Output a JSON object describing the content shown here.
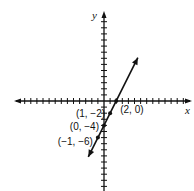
{
  "chart_data": {
    "type": "line",
    "title": "",
    "xlabel": "x",
    "ylabel": "y",
    "xlim": [
      -10,
      10
    ],
    "ylim": [
      -10,
      10
    ],
    "grid": false,
    "tick_spacing": 1,
    "line": {
      "slope": 2,
      "intercept": -4,
      "equation": "y = 2x - 4",
      "arrows_both_ends": true
    },
    "points": [
      {
        "x": 2,
        "y": 0,
        "label": "(2, 0)"
      },
      {
        "x": 1,
        "y": -2,
        "label": "(1, −2)"
      },
      {
        "x": 0,
        "y": -4,
        "label": "(0, −4)"
      },
      {
        "x": -1,
        "y": -6,
        "label": "(−1, −6)"
      }
    ]
  },
  "axes": {
    "x_label": "x",
    "y_label": "y"
  }
}
